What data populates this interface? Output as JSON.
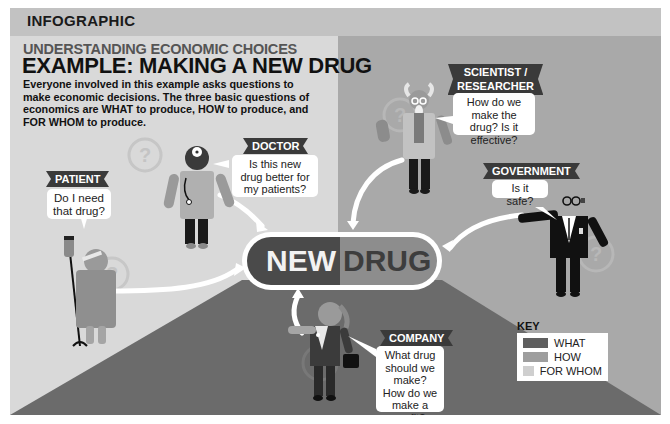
{
  "header": {
    "label": "INFOGRAPHIC"
  },
  "heading": {
    "subtitle": "UNDERSTANDING ECONOMIC CHOICES",
    "title": "EXAMPLE: MAKING A NEW DRUG",
    "intro": "Everyone involved in this example asks questions to make economic decisions. The three basic questions of economics are WHAT to produce, HOW to produce, and FOR WHOM to produce."
  },
  "center": {
    "word1": "NEW",
    "word2": "DRUG"
  },
  "actors": [
    {
      "id": "patient",
      "label": "PATIENT",
      "question": "Do I need that drug?",
      "category": "FOR WHOM"
    },
    {
      "id": "doctor",
      "label": "DOCTOR",
      "question": "Is this new drug better for my patients?",
      "category": "FOR WHOM"
    },
    {
      "id": "scientist",
      "label": "SCIENTIST / RESEARCHER",
      "label_line1": "SCIENTIST /",
      "label_line2": "RESEARCHER",
      "question": "How do we make the drug? Is it effective?",
      "category": "HOW"
    },
    {
      "id": "government",
      "label": "GOVERNMENT",
      "question": "Is it safe?",
      "category": "HOW"
    },
    {
      "id": "company",
      "label": "COMPANY",
      "question": "What drug should we make? How do we make a profit?",
      "category": "WHAT"
    }
  ],
  "key": {
    "title": "KEY",
    "items": [
      {
        "label": "WHAT",
        "color": "#5f5f5f"
      },
      {
        "label": "HOW",
        "color": "#9e9e9e"
      },
      {
        "label": "FOR WHOM",
        "color": "#cfcfcf"
      }
    ]
  },
  "colors": {
    "for_whom_region": "#d9d9d9",
    "how_region": "#a9a9a9",
    "what_region": "#6b6b6b",
    "header_bar": "#c2c2c2",
    "tag": "#3a3a3a"
  }
}
